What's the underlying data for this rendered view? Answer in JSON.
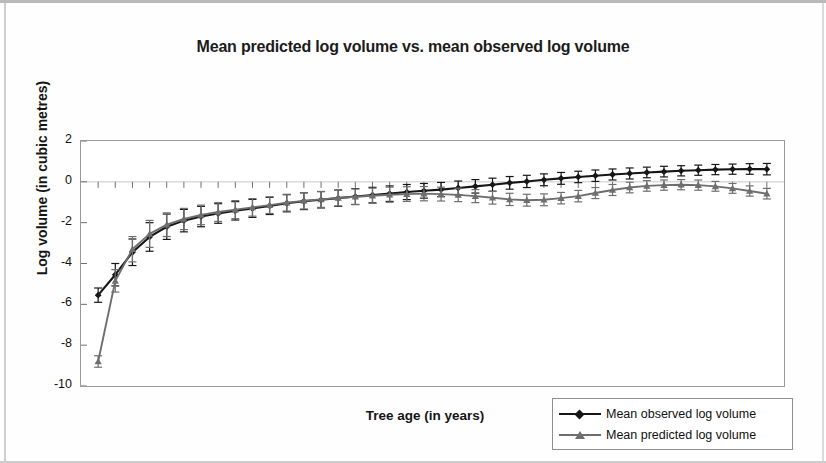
{
  "chart_data": {
    "type": "line",
    "title": "Mean predicted log volume vs. mean observed log volume",
    "xlabel": "Tree age (in years)",
    "ylabel": "Log volume (in cubic metres)",
    "xlim": [
      0,
      41
    ],
    "ylim": [
      -10,
      2
    ],
    "yticks": [
      2,
      0,
      -2,
      -4,
      -6,
      -8,
      -10
    ],
    "xticks": [
      1,
      3,
      5,
      7,
      9,
      11,
      13,
      15,
      17,
      19,
      21,
      23,
      25,
      27,
      29,
      31,
      33,
      35,
      37,
      39
    ],
    "grid": false,
    "legend_position": "bottom-right",
    "error_bars": true,
    "x": [
      1,
      2,
      3,
      4,
      5,
      6,
      7,
      8,
      9,
      10,
      11,
      12,
      13,
      14,
      15,
      16,
      17,
      18,
      19,
      20,
      21,
      22,
      23,
      24,
      25,
      26,
      27,
      28,
      29,
      30,
      31,
      32,
      33,
      34,
      35,
      36,
      37,
      38,
      39,
      40
    ],
    "series": [
      {
        "name": "Mean observed log volume",
        "color": "#161616",
        "marker": "diamond",
        "values": [
          -5.55,
          -4.55,
          -3.45,
          -2.7,
          -2.2,
          -1.9,
          -1.7,
          -1.55,
          -1.42,
          -1.3,
          -1.18,
          -1.05,
          -0.95,
          -0.88,
          -0.8,
          -0.72,
          -0.65,
          -0.58,
          -0.5,
          -0.44,
          -0.38,
          -0.3,
          -0.22,
          -0.14,
          -0.05,
          0.02,
          0.1,
          0.17,
          0.24,
          0.3,
          0.36,
          0.41,
          0.46,
          0.5,
          0.54,
          0.57,
          0.6,
          0.62,
          0.63,
          0.62
        ],
        "errors": [
          0.35,
          0.55,
          0.65,
          0.7,
          0.62,
          0.55,
          0.5,
          0.48,
          0.45,
          0.44,
          0.42,
          0.42,
          0.41,
          0.4,
          0.4,
          0.39,
          0.38,
          0.38,
          0.37,
          0.36,
          0.35,
          0.34,
          0.33,
          0.32,
          0.31,
          0.3,
          0.29,
          0.29,
          0.28,
          0.28,
          0.27,
          0.27,
          0.26,
          0.26,
          0.25,
          0.25,
          0.25,
          0.25,
          0.26,
          0.28
        ]
      },
      {
        "name": "Mean predicted log volume",
        "color": "#6e6e6e",
        "marker": "triangle",
        "values": [
          -8.8,
          -4.85,
          -3.3,
          -2.55,
          -2.1,
          -1.82,
          -1.62,
          -1.48,
          -1.36,
          -1.25,
          -1.14,
          -1.02,
          -0.93,
          -0.86,
          -0.79,
          -0.73,
          -0.68,
          -0.63,
          -0.6,
          -0.58,
          -0.6,
          -0.64,
          -0.7,
          -0.78,
          -0.86,
          -0.9,
          -0.88,
          -0.8,
          -0.7,
          -0.55,
          -0.4,
          -0.28,
          -0.2,
          -0.16,
          -0.14,
          -0.16,
          -0.22,
          -0.32,
          -0.45,
          -0.58
        ],
        "errors": [
          0.28,
          0.55,
          0.62,
          0.66,
          0.58,
          0.52,
          0.48,
          0.46,
          0.44,
          0.43,
          0.41,
          0.41,
          0.4,
          0.39,
          0.39,
          0.38,
          0.37,
          0.37,
          0.36,
          0.35,
          0.34,
          0.33,
          0.32,
          0.31,
          0.3,
          0.29,
          0.29,
          0.28,
          0.28,
          0.27,
          0.27,
          0.26,
          0.26,
          0.25,
          0.25,
          0.25,
          0.24,
          0.24,
          0.25,
          0.26
        ]
      }
    ]
  },
  "legend": {
    "items": [
      {
        "label": "Mean observed log volume"
      },
      {
        "label": "Mean predicted log volume"
      }
    ]
  }
}
